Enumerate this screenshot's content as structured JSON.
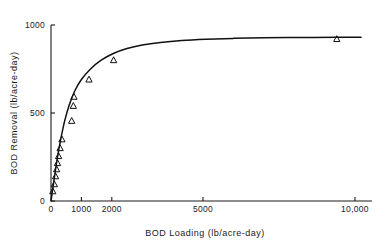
{
  "chart_data": {
    "type": "scatter",
    "title": "",
    "xlabel": "BOD Loading (lb/acre-day)",
    "ylabel": "BOD Removal (lb/acre-day)",
    "xlim": [
      0,
      10500
    ],
    "ylim": [
      0,
      1000
    ],
    "xticks": [
      0,
      1000,
      2000,
      5000,
      10000
    ],
    "xticklabels": [
      "0",
      "1000",
      "2000",
      "5000",
      "10,000"
    ],
    "yticks": [
      0,
      500,
      1000
    ],
    "yticklabels": [
      "0",
      "500",
      "1000"
    ],
    "grid": false,
    "legend": false,
    "marker_symbol": "triangle-open",
    "line_color": "#111111",
    "marker_color": "#111111",
    "series": [
      {
        "name": "BOD removal data",
        "marker": "open-triangle",
        "points": [
          [
            60,
            55
          ],
          [
            110,
            95
          ],
          [
            150,
            140
          ],
          [
            185,
            180
          ],
          [
            215,
            215
          ],
          [
            250,
            255
          ],
          [
            300,
            300
          ],
          [
            360,
            350
          ],
          [
            680,
            455
          ],
          [
            735,
            540
          ],
          [
            755,
            592
          ],
          [
            1250,
            690
          ],
          [
            2060,
            800
          ],
          [
            9400,
            920
          ]
        ]
      }
    ],
    "fitted_curve": {
      "name": "saturation fit",
      "description": "rises steeply from origin then plateaus near 930 lb/acre-day",
      "plateau": 930,
      "points": [
        [
          0,
          0
        ],
        [
          100,
          120
        ],
        [
          200,
          235
        ],
        [
          320,
          350
        ],
        [
          450,
          455
        ],
        [
          600,
          545
        ],
        [
          780,
          625
        ],
        [
          1000,
          690
        ],
        [
          1300,
          750
        ],
        [
          1650,
          800
        ],
        [
          2050,
          838
        ],
        [
          2500,
          866
        ],
        [
          3000,
          886
        ],
        [
          3600,
          901
        ],
        [
          4300,
          912
        ],
        [
          5100,
          919
        ],
        [
          6000,
          924
        ],
        [
          7000,
          927
        ],
        [
          8200,
          929
        ],
        [
          9400,
          930
        ],
        [
          10200,
          930
        ]
      ]
    }
  }
}
